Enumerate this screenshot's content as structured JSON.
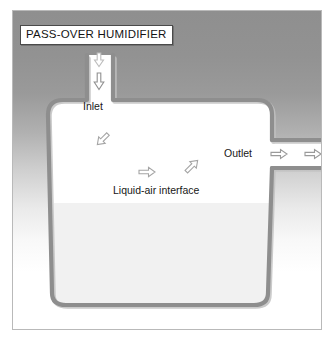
{
  "figure": {
    "title": "PASS-OVER HUMIDIFIER",
    "width": 336,
    "height": 340
  },
  "labels": {
    "inlet": "Inlet",
    "outlet": "Outlet",
    "interface": "Liquid-air interface"
  },
  "colors": {
    "vessel_wall": "#8e8e8e",
    "vessel_wall_shadow": "#b5b5b5",
    "air_space": "#ffffff",
    "liquid": "#f1f1f1",
    "arrow_stroke": "#9a9a9a",
    "arrow_stroke_dark": "#7d7d7d",
    "frame_border": "#b9b9b9",
    "title_border": "#4a4a4a",
    "text": "#141414",
    "backdrop_top": "#8f8f8f",
    "backdrop_bottom": "#ffffff"
  },
  "diagram": {
    "type": "schematic",
    "regions": [
      {
        "name": "air-space",
        "label": "gas space above liquid",
        "fill": "#ffffff"
      },
      {
        "name": "liquid-pool",
        "label": "liquid",
        "fill": "#f1f1f1",
        "surface_y": 203
      }
    ],
    "ports": [
      {
        "name": "inlet",
        "label": "Inlet",
        "orientation": "vertical",
        "flow": "downward",
        "position": "top-left"
      },
      {
        "name": "outlet",
        "label": "Outlet",
        "orientation": "horizontal",
        "flow": "rightward",
        "position": "right"
      }
    ],
    "flow_arrows": [
      {
        "name": "inlet-arrow-upper",
        "direction": "down",
        "x": 99,
        "y": 60
      },
      {
        "name": "inlet-arrow-lower",
        "direction": "down",
        "x": 99,
        "y": 81
      },
      {
        "name": "stream-arrow-upper-left",
        "direction": "down-right",
        "x": 103,
        "y": 140
      },
      {
        "name": "stream-arrow-middle",
        "direction": "right",
        "x": 147,
        "y": 172
      },
      {
        "name": "stream-arrow-upper-right",
        "direction": "up-right",
        "x": 192,
        "y": 166
      },
      {
        "name": "outlet-arrow-inner",
        "direction": "right",
        "x": 279,
        "y": 154
      },
      {
        "name": "outlet-arrow-outer",
        "direction": "right",
        "x": 312,
        "y": 154
      }
    ]
  }
}
